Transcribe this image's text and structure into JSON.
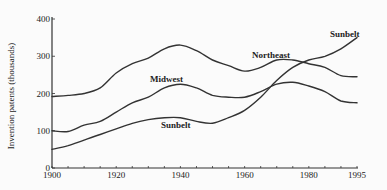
{
  "chart_data": {
    "type": "line",
    "title": "",
    "xlabel": "",
    "ylabel": "Invention patents (thousands)",
    "xlim": [
      1900,
      1995
    ],
    "ylim": [
      0,
      400
    ],
    "grid": false,
    "legend_position": "inline labels",
    "x_ticks": [
      1900,
      1920,
      1940,
      1960,
      1980,
      1995
    ],
    "x_tick_labels": [
      "1900",
      "1920",
      "1940",
      "1960",
      "1980",
      "1995"
    ],
    "y_ticks": [
      0,
      100,
      200,
      300,
      400
    ],
    "y_tick_labels": [
      "0",
      "100",
      "200",
      "300",
      "400"
    ],
    "x": [
      1900,
      1905,
      1910,
      1915,
      1920,
      1925,
      1930,
      1935,
      1940,
      1945,
      1950,
      1955,
      1960,
      1965,
      1970,
      1975,
      1980,
      1985,
      1990,
      1995
    ],
    "series": [
      {
        "name": "Northeast",
        "values": [
          192,
          195,
          200,
          215,
          255,
          280,
          295,
          320,
          330,
          315,
          290,
          275,
          260,
          270,
          290,
          290,
          280,
          270,
          248,
          245
        ],
        "label_pos": {
          "x": 252,
          "y": 58
        }
      },
      {
        "name": "Midwest",
        "values": [
          100,
          98,
          115,
          125,
          150,
          175,
          190,
          215,
          225,
          215,
          195,
          190,
          190,
          205,
          225,
          230,
          220,
          205,
          180,
          175
        ],
        "label_pos": {
          "x": 150,
          "y": 82
        }
      },
      {
        "name": "Sunbelt",
        "values": [
          50,
          60,
          75,
          90,
          105,
          120,
          130,
          135,
          135,
          125,
          120,
          135,
          155,
          190,
          235,
          270,
          290,
          300,
          320,
          350
        ],
        "label_pos": {
          "x": 161,
          "y": 128
        }
      }
    ],
    "extra_labels": [
      {
        "text": "Sunbelt",
        "x": 330,
        "y": 37
      }
    ]
  }
}
